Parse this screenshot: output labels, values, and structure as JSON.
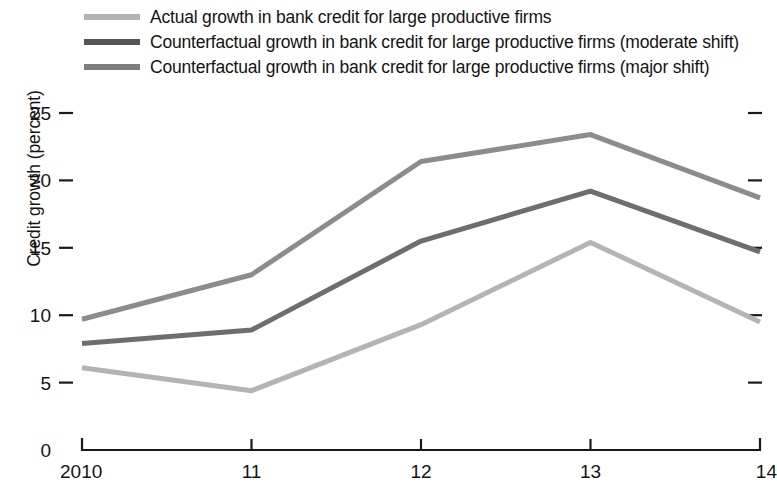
{
  "chart_data": {
    "type": "line",
    "title": "",
    "xlabel": "",
    "ylabel": "Credit growth (percent)",
    "x": [
      2010,
      11,
      12,
      13,
      14
    ],
    "xtick_labels": [
      "2010",
      "11",
      "12",
      "13",
      "14"
    ],
    "ytick_labels": [
      "0",
      "5",
      "10",
      "15",
      "20",
      "25"
    ],
    "ytick_values": [
      0,
      5,
      10,
      15,
      20,
      25
    ],
    "ylim": [
      0,
      26.5
    ],
    "xlim": [
      2010,
      14
    ],
    "grid": false,
    "legend_position": "top-left",
    "right_axis_ticks": [
      5,
      10,
      15,
      20,
      25
    ],
    "series": [
      {
        "name": "Actual growth in bank credit for large productive firms",
        "color": "#b4b4b4",
        "values": [
          6.1,
          4.4,
          9.3,
          15.4,
          9.5
        ]
      },
      {
        "name": "Counterfactual growth in bank credit for large productive firms (moderate shift)",
        "color": "#6e6e6e",
        "values": [
          7.9,
          8.9,
          15.5,
          19.2,
          14.7
        ]
      },
      {
        "name": "Counterfactual growth in bank credit for large productive firms (major shift)",
        "color": "#8c8c8c",
        "values": [
          9.7,
          13.0,
          21.4,
          23.4,
          18.7
        ]
      }
    ]
  },
  "legend": {
    "items": [
      {
        "label": "Actual growth in bank credit for large productive firms",
        "color": "#b4b4b4"
      },
      {
        "label": "Counterfactual growth in bank credit for large productive firms (moderate shift)",
        "color": "#555555"
      },
      {
        "label": "Counterfactual growth in bank credit for large productive firms (major shift)",
        "color": "#7d7d7d"
      }
    ]
  },
  "axes": {
    "y_title": "Credit growth (percent)"
  }
}
